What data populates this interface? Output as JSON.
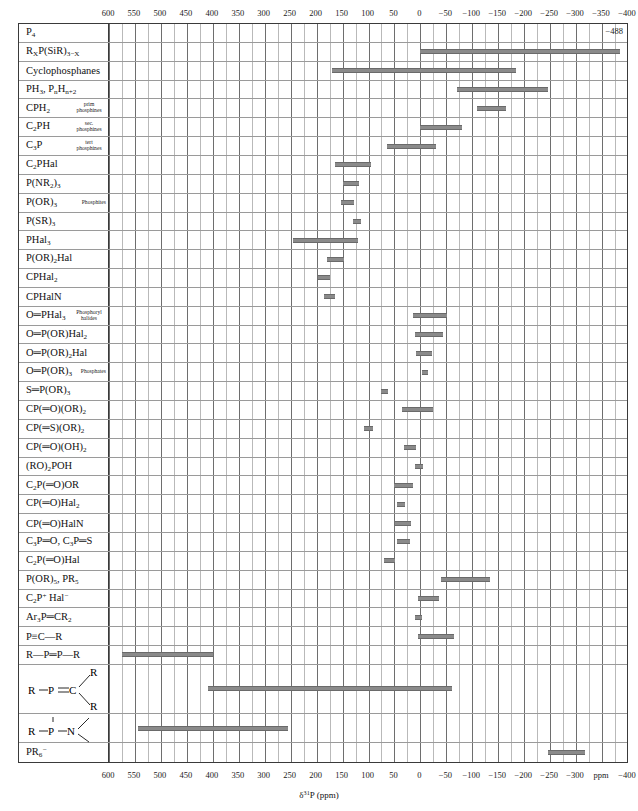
{
  "chart_data": {
    "type": "bar",
    "title": "",
    "xlabel": "δ³¹P (ppm)",
    "ylabel": "",
    "xlim": [
      600,
      -400
    ],
    "axis_unit": "ppm",
    "axis_major_ticks": [
      600,
      550,
      500,
      450,
      400,
      350,
      300,
      250,
      200,
      150,
      100,
      50,
      0,
      -50,
      -100,
      -150,
      -200,
      -250,
      -300,
      -400
    ],
    "axis_major_tick_labels": [
      "600",
      "550",
      "500",
      "450",
      "400",
      "350",
      "300",
      "250",
      "200",
      "150",
      "100",
      "50",
      "0",
      "−50",
      "−100",
      "−150",
      "−200",
      "−250",
      "−300",
      "−400"
    ],
    "axis_ppm_marker": "ppm",
    "minor_tick_step": 25,
    "grid": true,
    "bar_color": "#8a8a8a",
    "categories": [
      "P4",
      "RxP(SiR)3-x",
      "Cyclophosphanes",
      "PH3, PnHn+2",
      "CPH2 (prim phosphines)",
      "C2PH (sec. phosphines)",
      "C3P (tert phosphines)",
      "C2PHal",
      "P(NR2)3",
      "P(OR)3 (Phosphites)",
      "P(SR)3",
      "PHal3",
      "P(OR)2Hal",
      "CPHal2",
      "CPHalN",
      "O=PHal3 (Phosphoryl halides)",
      "O=P(OR)Hal2",
      "O=P(OR)2Hal",
      "O=P(OR)3 (Phosphates)",
      "S=P(OR)3",
      "CP(=O)(OR)2",
      "CP(=S)(OR)2",
      "CP(=O)(OH)2",
      "(RO)2POH",
      "C2P(=O)OR",
      "CP(=O)Hal2",
      "CP(=O)HalN",
      "C3P=O, C3P=S",
      "C2P(=O)Hal",
      "P(OR)5, PR5",
      "C2P+ Hal-",
      "Ar3P=CR2",
      "P#C-R",
      "R-P=P-R",
      "R-P=CR2",
      "R-P-NR2",
      "PR6-"
    ],
    "ranges": [
      {
        "label": "P4",
        "from": null,
        "to": null,
        "annotation": "−488"
      },
      {
        "label": "RxP(SiR)3−x",
        "from": 0,
        "to": -385
      },
      {
        "label": "Cyclophosphanes",
        "from": 170,
        "to": -185
      },
      {
        "label": "PH3, PnHn+2",
        "from": -70,
        "to": -245
      },
      {
        "label": "CPH2",
        "from": -110,
        "to": -165
      },
      {
        "label": "C2PH",
        "from": 0,
        "to": -80
      },
      {
        "label": "C3P",
        "from": 65,
        "to": -30
      },
      {
        "label": "C2PHal",
        "from": 165,
        "to": 95
      },
      {
        "label": "P(NR2)3",
        "from": 150,
        "to": 118
      },
      {
        "label": "P(OR)3",
        "from": 153,
        "to": 128
      },
      {
        "label": "P(SR)3",
        "from": 130,
        "to": 115
      },
      {
        "label": "PHal3",
        "from": 245,
        "to": 120
      },
      {
        "label": "P(OR)2Hal",
        "from": 180,
        "to": 147
      },
      {
        "label": "CPHal2",
        "from": 198,
        "to": 175
      },
      {
        "label": "CPHalN",
        "from": 185,
        "to": 165
      },
      {
        "label": "O=PHal3",
        "from": 15,
        "to": -52
      },
      {
        "label": "O=P(OR)Hal2",
        "from": 10,
        "to": -43
      },
      {
        "label": "O=P(OR)2Hal",
        "from": 8,
        "to": -23
      },
      {
        "label": "O=P(OR)3",
        "from": -3,
        "to": -15
      },
      {
        "label": "S=P(OR)3",
        "from": 75,
        "to": 62
      },
      {
        "label": "CP(=O)(OR)2",
        "from": 35,
        "to": -25
      },
      {
        "label": "CP(=S)(OR)2",
        "from": 108,
        "to": 92
      },
      {
        "label": "CP(=O)(OH)2",
        "from": 32,
        "to": 8
      },
      {
        "label": "(RO)2POH",
        "from": 10,
        "to": -5
      },
      {
        "label": "C2P(=O)OR",
        "from": 50,
        "to": 15
      },
      {
        "label": "CP(=O)Hal2",
        "from": 45,
        "to": 30
      },
      {
        "label": "CP(=O)HalN",
        "from": 48,
        "to": 18
      },
      {
        "label": "C3P=O, C3P=S",
        "from": 45,
        "to": 20
      },
      {
        "label": "C2P(=O)Hal",
        "from": 70,
        "to": 48
      },
      {
        "label": "P(OR)5, PR5",
        "from": -40,
        "to": -135
      },
      {
        "label": "C2P+ Hal−",
        "from": 5,
        "to": -35
      },
      {
        "label": "Ar3P=CR2",
        "from": 10,
        "to": -3
      },
      {
        "label": "P≡C—R",
        "from": 5,
        "to": -65
      },
      {
        "label": "R—P=P—R",
        "from": 575,
        "to": 400
      },
      {
        "label": "R—P=CR2",
        "from": 410,
        "to": -60
      },
      {
        "label": "R—P—NR2",
        "from": 545,
        "to": 255
      },
      {
        "label": "PR6−",
        "from": -245,
        "to": -318
      }
    ]
  },
  "axis": {
    "top_ticks": [
      "600",
      "550",
      "500",
      "450",
      "400",
      "350",
      "300",
      "250",
      "200",
      "150",
      "100",
      "50",
      "0",
      "−50",
      "−100",
      "−150",
      "−200",
      "−250",
      "−300",
      "−350",
      "−400"
    ],
    "bottom_ticks": [
      "600",
      "550",
      "500",
      "450",
      "400",
      "350",
      "300",
      "250",
      "200",
      "150",
      "100",
      "50",
      "0",
      "−50",
      "−100",
      "−150",
      "−200",
      "−250",
      "−300",
      "ppm",
      "−400"
    ],
    "xlabel_delta": "δ",
    "xlabel_sup": "31",
    "xlabel_rest": "P (ppm)"
  },
  "annotations": {
    "p4_value": "−488"
  },
  "rows": [
    {
      "id": "p4",
      "main": "P",
      "mainsub": "4",
      "sub": ""
    },
    {
      "id": "rxp-sir",
      "html": "R<sub>X</sub>P(SiR)<sub>3−X</sub>",
      "sub": ""
    },
    {
      "id": "cyclophosphanes",
      "html": "Cyclophosphanes",
      "sub": ""
    },
    {
      "id": "ph3",
      "html": "PH<sub>3</sub>, P<sub>n</sub>H<sub>n+2</sub>",
      "sub": ""
    },
    {
      "id": "cph2",
      "html": "CPH<sub>2</sub>",
      "sub": "prim phosphines"
    },
    {
      "id": "c2ph",
      "html": "C<sub>2</sub>PH",
      "sub": "sec. phosphines"
    },
    {
      "id": "c3p",
      "html": "C<sub>3</sub>P",
      "sub": "tert phosphines"
    },
    {
      "id": "c2phal",
      "html": "C<sub>2</sub>PHal",
      "sub": ""
    },
    {
      "id": "pnr23",
      "html": "P(NR<sub>2</sub>)<sub>3</sub>",
      "sub": ""
    },
    {
      "id": "por3",
      "html": "P(OR)<sub>3</sub>",
      "sub": "Phosphites"
    },
    {
      "id": "psr3",
      "html": "P(SR)<sub>3</sub>",
      "sub": ""
    },
    {
      "id": "phal3",
      "html": "PHal<sub>3</sub>",
      "sub": ""
    },
    {
      "id": "por2hal",
      "html": "P(OR)<sub>2</sub>Hal",
      "sub": ""
    },
    {
      "id": "cphal2",
      "html": "CPHal<sub>2</sub>",
      "sub": ""
    },
    {
      "id": "cphaln",
      "html": "CPHalN",
      "sub": ""
    },
    {
      "id": "ophal3",
      "html": "O═PHal<sub>3</sub>",
      "sub": "Phosphoryl halides"
    },
    {
      "id": "oporhal2",
      "html": "O═P(OR)Hal<sub>2</sub>",
      "sub": ""
    },
    {
      "id": "opor2hal",
      "html": "O═P(OR)<sub>2</sub>Hal",
      "sub": ""
    },
    {
      "id": "opor3",
      "html": "O═P(OR)<sub>3</sub>",
      "sub": "Phosphates"
    },
    {
      "id": "spor3",
      "html": "S═P(OR)<sub>3</sub>",
      "sub": ""
    },
    {
      "id": "cpo-or2",
      "html": "CP(═O)(OR)<sub>2</sub>",
      "sub": ""
    },
    {
      "id": "cps-or2",
      "html": "CP(═S)(OR)<sub>2</sub>",
      "sub": ""
    },
    {
      "id": "cpo-oh2",
      "html": "CP(═O)(OH)<sub>2</sub>",
      "sub": ""
    },
    {
      "id": "ro2poh",
      "html": "(RO)<sub>2</sub>POH",
      "sub": ""
    },
    {
      "id": "c2po-or",
      "html": "C<sub>2</sub>P(═O)OR",
      "sub": ""
    },
    {
      "id": "cpo-hal2",
      "html": "CP(═O)Hal<sub>2</sub>",
      "sub": ""
    },
    {
      "id": "cpo-haln",
      "html": "CP(═O)HalN",
      "sub": ""
    },
    {
      "id": "c3po-c3ps",
      "html": "C<sub>3</sub>P═O, C<sub>3</sub>P═S",
      "sub": ""
    },
    {
      "id": "c2po-hal",
      "html": "C<sub>2</sub>P(═O)Hal",
      "sub": ""
    },
    {
      "id": "por5-pr5",
      "html": "P(OR)<sub>5</sub>, PR<sub>5</sub>",
      "sub": ""
    },
    {
      "id": "c2p-hal",
      "html": "C<sub>2</sub>P<sup>+</sup> Hal<sup>−</sup>",
      "sub": ""
    },
    {
      "id": "ar3p-cr2",
      "html": "Ar<sub>3</sub>P═CR<sub>2</sub>",
      "sub": ""
    },
    {
      "id": "p-c-r",
      "html": "P≡C—R",
      "sub": ""
    },
    {
      "id": "r-p-p-r",
      "html": "R—P═P—R",
      "sub": ""
    },
    {
      "id": "r-p-cr2",
      "html": "",
      "sub": "",
      "structure": "r-p-c-r2"
    },
    {
      "id": "r-p-nr2",
      "html": "",
      "sub": "",
      "structure": "r-p-n"
    },
    {
      "id": "pr6",
      "html": "PR<sub>6</sub><sup>−</sup>",
      "sub": ""
    }
  ]
}
